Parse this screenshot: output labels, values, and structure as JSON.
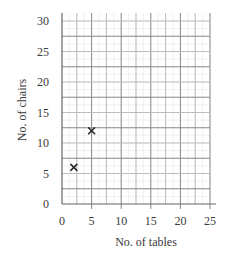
{
  "chart_data": {
    "type": "scatter",
    "title": "",
    "xlabel": "No. of tables",
    "ylabel": "No. of chairs",
    "xlim": [
      0,
      25
    ],
    "ylim": [
      0,
      30
    ],
    "xticks": [
      0,
      5,
      10,
      15,
      20,
      25
    ],
    "yticks": [
      0,
      5,
      10,
      15,
      20,
      25,
      30
    ],
    "xtick_labels": [
      "0",
      "5",
      "10",
      "15",
      "20",
      "25"
    ],
    "ytick_labels": [
      "0",
      "5",
      "10",
      "15",
      "20",
      "25",
      "30"
    ],
    "grid": true,
    "grid_step_x": 2.5,
    "grid_step_y": 2.5,
    "marker": "x",
    "series": [
      {
        "name": "points",
        "points": [
          {
            "x": 2,
            "y": 6
          },
          {
            "x": 5,
            "y": 12
          }
        ]
      }
    ],
    "legend": "none"
  }
}
